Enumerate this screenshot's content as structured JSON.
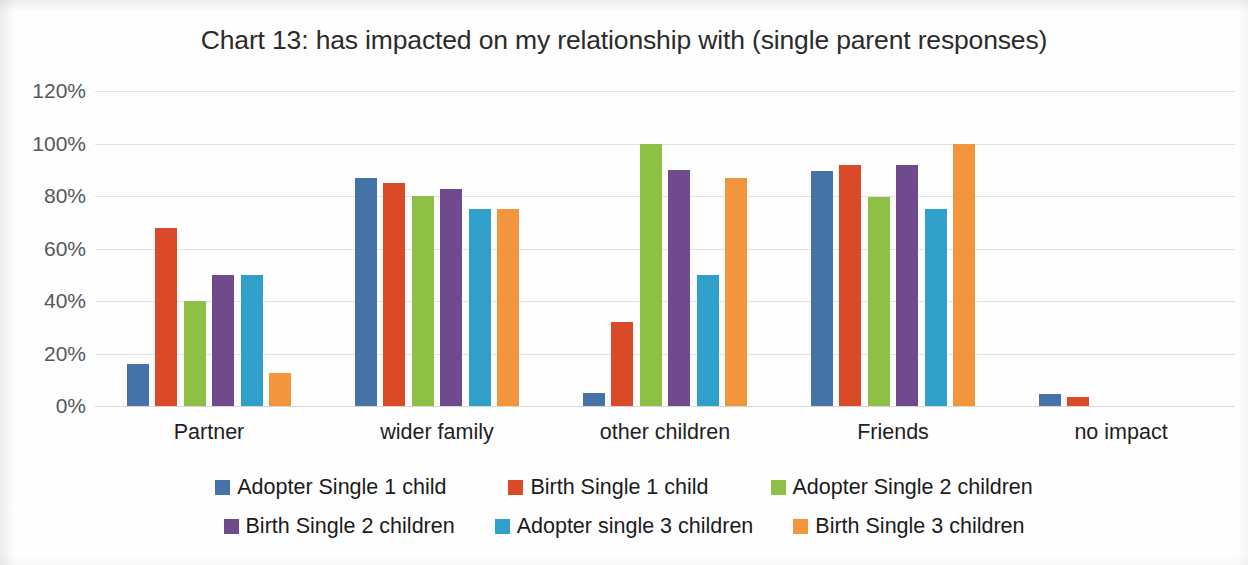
{
  "chart_data": {
    "type": "bar",
    "title": "Chart 13: has impacted on my relationship with (single parent responses)",
    "subtitle": "",
    "xlabel": "",
    "ylabel": "",
    "ylim": [
      0,
      120
    ],
    "y_tick_labels": [
      "120%",
      "100%",
      "80%",
      "60%",
      "40%",
      "20%",
      "0%"
    ],
    "y_tick_values": [
      120,
      100,
      80,
      60,
      40,
      20,
      0
    ],
    "grid": true,
    "grid_axis": "y",
    "legend_position": "bottom",
    "categories": [
      "Partner",
      "wider family",
      "other children",
      "Friends",
      "no impact"
    ],
    "series": [
      {
        "name": "Adopter Single 1 child",
        "color": "#4572A7",
        "values": [
          16,
          87,
          5,
          89.5,
          4.5
        ]
      },
      {
        "name": "Birth Single 1 child",
        "color": "#DB4A28",
        "values": [
          68,
          85,
          32,
          92,
          3.5
        ]
      },
      {
        "name": "Adopter Single 2 children",
        "color": "#8DC044",
        "values": [
          40,
          80,
          100,
          79.5,
          0
        ]
      },
      {
        "name": "Birth Single 2 children",
        "color": "#6F4B8E",
        "values": [
          50,
          82.5,
          90,
          92,
          0
        ]
      },
      {
        "name": "Adopter single 3 children",
        "color": "#30A0CA",
        "values": [
          50,
          75,
          50,
          75,
          0
        ]
      },
      {
        "name": "Birth Single 3 children",
        "color": "#F2953D",
        "values": [
          12.5,
          75,
          87,
          100,
          0
        ]
      }
    ]
  },
  "legend_rows": [
    [
      0,
      1,
      2
    ],
    [
      3,
      4,
      5
    ]
  ],
  "legend_row_gaps": [
    62,
    40
  ],
  "colors": {
    "gridline": "#e2e2e2",
    "background": "#fefefe",
    "title_text": "#2b2b2b",
    "axis_text": "#56585b",
    "category_text": "#1f1f1f",
    "legend_text": "#1b1b1b"
  }
}
